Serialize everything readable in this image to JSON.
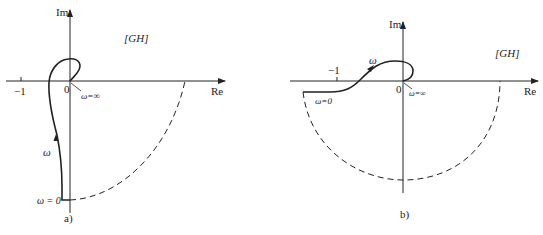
{
  "figure_a": {
    "caption": "a)",
    "im_label": "Im",
    "re_label": "Re",
    "region_label": "[GH]",
    "origin_label": "0",
    "minus_one_label": "−1",
    "omega_label": "ω",
    "omega_zero_label": "ω = 0",
    "omega_inf_label": "ω=∞"
  },
  "figure_b": {
    "caption": "b)",
    "im_label": "Im",
    "re_label": "Re",
    "region_label": "[GH]",
    "origin_label": "0",
    "minus_one_label": "−1",
    "omega_label": "ω",
    "omega_zero_label": "ω=0",
    "omega_inf_label": "ω=∞"
  },
  "colors": {
    "ink": "#222222",
    "background": "#ffffff"
  }
}
